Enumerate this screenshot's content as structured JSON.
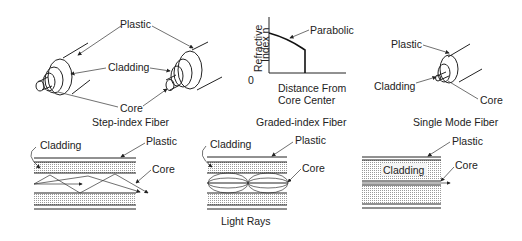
{
  "diagram": {
    "panels": [
      {
        "id": "step-index",
        "caption": "Step-index Fiber",
        "labels": {
          "plastic": "Plastic",
          "cladding": "Cladding",
          "core": "Core"
        }
      },
      {
        "id": "graded-index",
        "caption": "Graded-index Fiber",
        "graph": {
          "ylabel_line1": "Refractive",
          "ylabel_line2": "Index n",
          "xlabel_line1": "Distance From",
          "xlabel_line2": "Core Center",
          "origin": "0",
          "curve_label": "Parabolic"
        }
      },
      {
        "id": "single-mode",
        "caption": "Single Mode Fiber",
        "labels": {
          "plastic": "Plastic",
          "cladding": "Cladding",
          "core": "Core"
        }
      }
    ],
    "cross_sections": [
      {
        "id": "step-index-rays",
        "labels": {
          "cladding": "Cladding",
          "plastic": "Plastic",
          "core": "Core"
        }
      },
      {
        "id": "graded-index-rays",
        "labels": {
          "cladding": "Cladding",
          "plastic": "Plastic",
          "core": "Core"
        },
        "caption": "Light Rays"
      },
      {
        "id": "single-mode-rays",
        "labels": {
          "cladding": "Cladding",
          "plastic": "Plastic",
          "core": "Core"
        }
      }
    ]
  }
}
